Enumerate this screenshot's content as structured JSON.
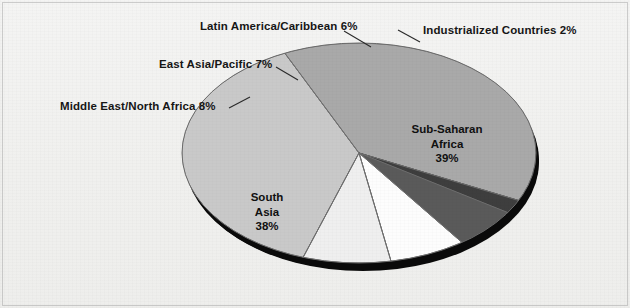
{
  "chart_data": {
    "type": "pie",
    "title": "",
    "subtitle": "",
    "xlabel": "",
    "ylabel": "",
    "legend_position": "none",
    "grid": false,
    "style": "3d-exploded-ellipse-grayscale",
    "unit": "%",
    "categories": [
      "Sub-Saharan Africa",
      "South Asia",
      "Middle East/North Africa",
      "East Asia/Pacific",
      "Latin America/Caribbean",
      "Industrialized Countries"
    ],
    "values": [
      39,
      38,
      8,
      7,
      6,
      2
    ],
    "slices": [
      {
        "name": "Sub-Saharan Africa",
        "value": 39,
        "label": "Sub-Saharan Africa 39%",
        "color": "#a9a9a9",
        "label_placement": "inside"
      },
      {
        "name": "South Asia",
        "value": 38,
        "label": "South Asia 38%",
        "color": "#c9c9c9",
        "label_placement": "inside"
      },
      {
        "name": "Middle East/North Africa",
        "value": 8,
        "label": "Middle East/North Africa 8%",
        "color": "#efefef",
        "label_placement": "outside-leader"
      },
      {
        "name": "East Asia/Pacific",
        "value": 7,
        "label": "East Asia/Pacific 7%",
        "color": "#fdfdfd",
        "label_placement": "outside-leader"
      },
      {
        "name": "Latin America/Caribbean",
        "value": 6,
        "label": "Latin America/Caribbean 6%",
        "color": "#5a5a5a",
        "label_placement": "outside-leader"
      },
      {
        "name": "Industrialized Countries",
        "value": 2,
        "label": "Industrialized Countries 2%",
        "color": "#3e3e3e",
        "label_placement": "outside-leader"
      }
    ]
  },
  "labels": {
    "latin_america": "Latin America/Caribbean 6%",
    "industrialized": "Industrialized Countries 2%",
    "east_asia": "East Asia/Pacific 7%",
    "middle_east": "Middle East/North Africa 8%",
    "sub_saharan_name": "Sub-Saharan",
    "sub_saharan_name2": "Africa",
    "sub_saharan_value": "39%",
    "south_asia_name": "South",
    "south_asia_name2": "Asia",
    "south_asia_value": "38%"
  },
  "colors": {
    "background": "#f1f1ef",
    "sub_saharan": "#a9a9a9",
    "south_asia": "#c9c9c9",
    "middle_east": "#efefef",
    "east_asia": "#fdfdfd",
    "latin_america": "#5a5a5a",
    "industrialized": "#3e3e3e",
    "shadow": "#000000",
    "outline": "#6b6b6b",
    "text": "#161616"
  }
}
